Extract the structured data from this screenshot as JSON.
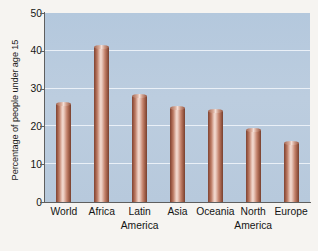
{
  "chart_data": {
    "type": "bar",
    "title": "",
    "subtitle": "",
    "xlabel": "",
    "ylabel": "Percentage of people under age 15",
    "categories": [
      "World",
      "Africa",
      "Latin America",
      "Asia",
      "Oceania",
      "North America",
      "Europe"
    ],
    "category_lines": [
      [
        "World"
      ],
      [
        "Africa"
      ],
      [
        "Latin",
        "America"
      ],
      [
        "Asia"
      ],
      [
        "Oceania"
      ],
      [
        "North",
        "America"
      ],
      [
        "Europe"
      ]
    ],
    "values": [
      26,
      41,
      28,
      25,
      24,
      19,
      15.5
    ],
    "ylim": [
      0,
      50
    ],
    "ytick_labels": [
      "0",
      "10",
      "20",
      "30",
      "40",
      "50"
    ],
    "ytick_values": [
      0,
      10,
      20,
      30,
      40,
      50
    ],
    "grid": true,
    "grid_orientation": "horizontal",
    "legend": false,
    "legend_position": "none",
    "bar_style": "3d-cylinder",
    "colors": {
      "page_background": "#f6f4f1",
      "plot_background": "#b9cbde",
      "gridline": "#eef3f8",
      "axis": "#5f5f5f",
      "bar_highlight": "#f4dcd2",
      "bar_mid": "#c4836c",
      "bar_edge": "#7d4434",
      "text": "#141414"
    }
  }
}
